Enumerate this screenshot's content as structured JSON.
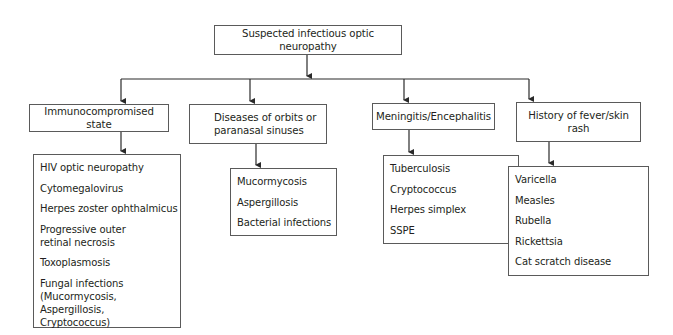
{
  "root": {
    "label": "Suspected infectious optic neuropathy"
  },
  "categories": [
    {
      "label": "Immunocompromised state",
      "items": [
        "HIV optic neuropathy",
        "Cytomegalovirus",
        "Herpes zoster ophthalmicus",
        "Progressive outer retinal necrosis",
        "Toxoplasmosis",
        "Fungal infections (Mucormycosis, Aspergillosis, Cryptococcus)"
      ]
    },
    {
      "label": "Diseases of orbits or paranasal sinuses",
      "items": [
        "Mucormycosis",
        "Aspergillosis",
        "Bacterial infections"
      ]
    },
    {
      "label": "Meningitis/Encephalitis",
      "items": [
        "Tuberculosis",
        "Cryptococcus",
        "Herpes simplex",
        "SSPE"
      ]
    },
    {
      "label": "History of fever/skin rash",
      "items": [
        "Varicella",
        "Measles",
        "Rubella",
        "Rickettsia",
        "Cat scratch disease"
      ]
    }
  ],
  "colors": {
    "line": "#2a2a2a",
    "border": "#5a5a5a",
    "text": "#231f20"
  }
}
